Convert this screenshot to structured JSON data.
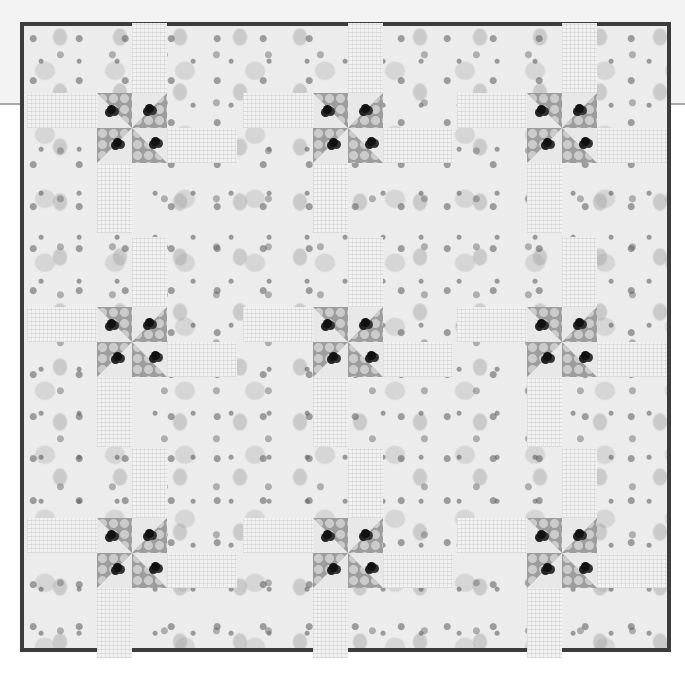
{
  "scene": {
    "subject": "Pinwheel block quilt photographed against a light wall",
    "palette": {
      "background": "#ffffff",
      "wall_line": "#a8a8a8",
      "binding": "#3c3c3c",
      "floral_base": "#ececec",
      "pinwheel_dark": "#9d9d9d",
      "strip_light": "#f2f2f2"
    },
    "grid": {
      "rows": 3,
      "cols": 3
    },
    "pinwheels": [
      {
        "x": 97,
        "y": 93
      },
      {
        "x": 313,
        "y": 93
      },
      {
        "x": 527,
        "y": 93
      },
      {
        "x": 97,
        "y": 307
      },
      {
        "x": 313,
        "y": 307
      },
      {
        "x": 527,
        "y": 307
      },
      {
        "x": 97,
        "y": 518
      },
      {
        "x": 313,
        "y": 518
      },
      {
        "x": 527,
        "y": 518
      }
    ]
  }
}
